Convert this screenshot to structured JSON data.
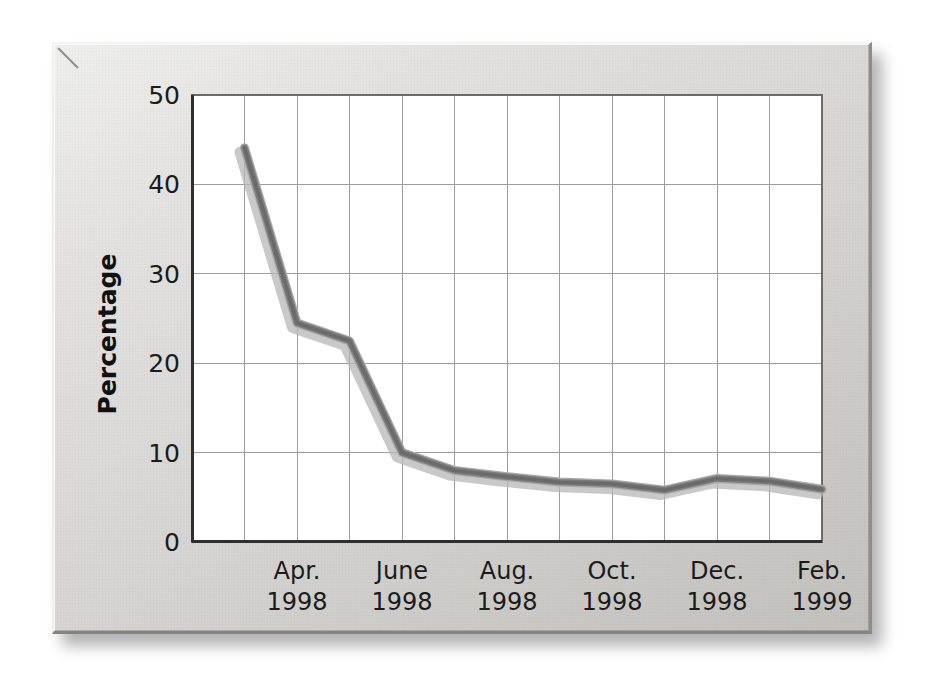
{
  "figure": {
    "frame_style": "beveled-gray-panel",
    "panel_color": "#dedddb",
    "plot_background": "#ffffff",
    "grid_color": "#9a9a9a",
    "axis_color": "#3a3a3a"
  },
  "chart_data": {
    "type": "line",
    "title": "",
    "xlabel": "",
    "ylabel": "Percentage",
    "ylim": [
      0,
      50
    ],
    "yticks": [
      0,
      10,
      20,
      30,
      40,
      50
    ],
    "ytick_labels": [
      "0",
      "10",
      "20",
      "30",
      "40",
      "50"
    ],
    "xtick_labels": [
      {
        "month": "Apr.",
        "year": "1998"
      },
      {
        "month": "June",
        "year": "1998"
      },
      {
        "month": "Aug.",
        "year": "1998"
      },
      {
        "month": "Oct.",
        "year": "1998"
      },
      {
        "month": "Dec.",
        "year": "1998"
      },
      {
        "month": "Feb.",
        "year": "1999"
      }
    ],
    "grid": true,
    "legend": null,
    "series": [
      {
        "name": "Percentage",
        "color": "#808080",
        "line_width": 7,
        "x": [
          1,
          2,
          3,
          4,
          5,
          6,
          7,
          8,
          9,
          10,
          11,
          12
        ],
        "x_labels": [
          "Mar. 1998",
          "Apr. 1998",
          "May 1998",
          "June 1998",
          "July 1998",
          "Aug. 1998",
          "Sept. 1998",
          "Oct. 1998",
          "Nov. 1998",
          "Dec. 1998",
          "Jan. 1999",
          "Feb. 1999"
        ],
        "values": [
          44.1,
          24.5,
          22.5,
          10.0,
          8.0,
          7.3,
          6.7,
          6.5,
          5.8,
          7.1,
          6.8,
          5.9
        ]
      }
    ]
  }
}
